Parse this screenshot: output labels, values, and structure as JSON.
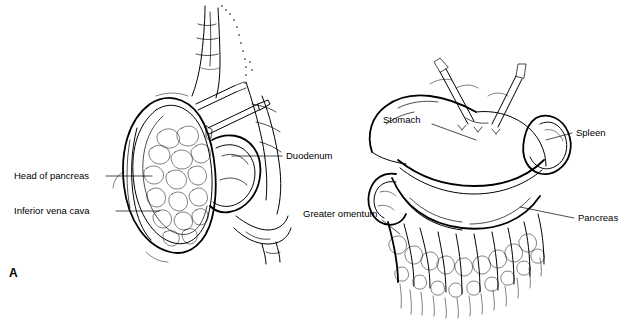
{
  "figure": {
    "panel_label": "A",
    "caption_labels": {
      "left_panel": [
        {
          "id": "head-of-pancreas",
          "text": "Head of pancreas"
        },
        {
          "id": "inferior-vena-cava",
          "text": "Inferior vena cava"
        },
        {
          "id": "duodenum",
          "text": "Duodenum"
        }
      ],
      "right_panel": [
        {
          "id": "stomach",
          "text": "Stomach"
        },
        {
          "id": "spleen",
          "text": "Spleen"
        },
        {
          "id": "pancreas",
          "text": "Pancreas"
        },
        {
          "id": "greater-omentum",
          "text": "Greater omentum"
        }
      ]
    },
    "style": {
      "ink_color": "#000000",
      "background_color": "#ffffff"
    }
  }
}
